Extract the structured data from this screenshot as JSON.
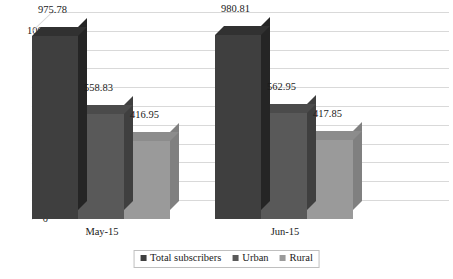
{
  "chart_data": {
    "type": "bar",
    "title": "",
    "subtitle": "",
    "xlabel": "",
    "ylabel": "",
    "categories": [
      "May-15",
      "Jun-15"
    ],
    "series": [
      {
        "name": "Total subscribers",
        "values": [
          975.78,
          980.81
        ],
        "color": "#3f3f3f"
      },
      {
        "name": "Urban",
        "values": [
          558.83,
          562.95
        ],
        "color": "#595959"
      },
      {
        "name": "Rural",
        "values": [
          416.95,
          417.85
        ],
        "color": "#9a9a9a"
      }
    ],
    "data_labels": [
      [
        "975.78",
        "558.83",
        "416.95"
      ],
      [
        "980.81",
        "562.95",
        "417.85"
      ]
    ],
    "ylim": [
      0,
      1000
    ],
    "ytick_labels": [
      "1000",
      "900",
      "800",
      "700",
      "600",
      "500",
      "400",
      "300",
      "200",
      "100",
      "0"
    ],
    "ytick_values": [
      1000,
      900,
      800,
      700,
      600,
      500,
      400,
      300,
      200,
      100,
      0
    ],
    "grid": true,
    "grid_color": "#d9d9d9",
    "legend_position": "bottom",
    "three_d": true,
    "background": "#ffffff"
  },
  "legend": {
    "items": [
      {
        "label": "Total subscribers",
        "color": "#3f3f3f"
      },
      {
        "label": "Urban",
        "color": "#595959"
      },
      {
        "label": "Rural",
        "color": "#9a9a9a"
      }
    ]
  }
}
